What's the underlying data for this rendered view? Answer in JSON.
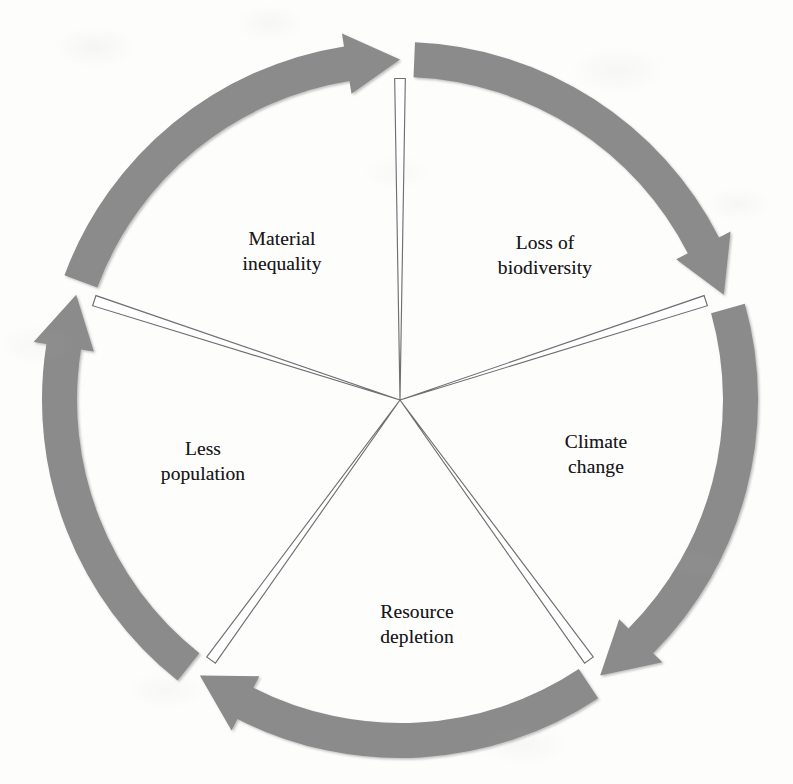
{
  "diagram": {
    "type": "cycle",
    "title": "",
    "direction": "clockwise",
    "segment_count": 5,
    "colors": {
      "arrow": "#8b8b8b",
      "arrow_shadow": "#9a9a9a",
      "divider_line": "#6f6f72",
      "label_text": "#17171a",
      "background": "#fdfdfc"
    },
    "geometry": {
      "center_x": 400,
      "center_y": 400,
      "outer_radius": 358,
      "band_thickness": 35,
      "start_angle_deg": -90
    },
    "segments": [
      {
        "id": "loss-of-biodiversity",
        "label": "Loss of\nbiodiversity",
        "label_x": 545,
        "label_y": 256,
        "start_angle_deg": -90,
        "end_angle_deg": -18
      },
      {
        "id": "climate-change",
        "label": "Climate\nchange",
        "label_x": 596,
        "label_y": 455,
        "start_angle_deg": -18,
        "end_angle_deg": 54
      },
      {
        "id": "resource-depletion",
        "label": "Resource\ndepletion",
        "label_x": 417,
        "label_y": 625,
        "start_angle_deg": 54,
        "end_angle_deg": 126
      },
      {
        "id": "less-population",
        "label": "Less\npopulation",
        "label_x": 203,
        "label_y": 462,
        "start_angle_deg": 126,
        "end_angle_deg": 198
      },
      {
        "id": "material-inequality",
        "label": "Material\ninequality",
        "label_x": 282,
        "label_y": 252,
        "start_angle_deg": 198,
        "end_angle_deg": 270
      }
    ]
  },
  "chart_data": {
    "type": "cycle-diagram",
    "title": "",
    "categories": [
      "Loss of biodiversity",
      "Climate change",
      "Resource depletion",
      "Less population",
      "Material inequality"
    ],
    "values": [
      72,
      72,
      72,
      72,
      72
    ],
    "unit": "degrees",
    "flow": "clockwise",
    "legend": [],
    "annotations": []
  }
}
